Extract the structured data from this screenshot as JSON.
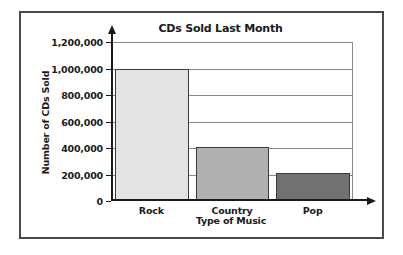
{
  "chart_data": {
    "type": "bar",
    "title": "CDs Sold Last Month",
    "xlabel": "Type of Music",
    "ylabel": "Number of CDs Sold",
    "categories": [
      "Rock",
      "Country",
      "Pop"
    ],
    "values": [
      1000000,
      410000,
      215000
    ],
    "series": [
      {
        "name": "CDs Sold",
        "values": [
          1000000,
          410000,
          215000
        ]
      }
    ],
    "ylim": [
      0,
      1200000
    ],
    "ytick_labels": [
      "1,200,000",
      "1,000,000",
      "800,000",
      "600,000",
      "400,000",
      "200,000",
      "0"
    ],
    "ytick_values": [
      1200000,
      1000000,
      800000,
      600000,
      400000,
      200000,
      0
    ],
    "grid": true,
    "legend": "none",
    "bar_colors": [
      "#e3e3e3",
      "#b0b0b0",
      "#727272"
    ],
    "bar_border_color": "#3c3c3c",
    "axis_color": "#1a1a1a",
    "gridline_color": "#8a8a8a",
    "frame_color": "#4a4a4a"
  }
}
